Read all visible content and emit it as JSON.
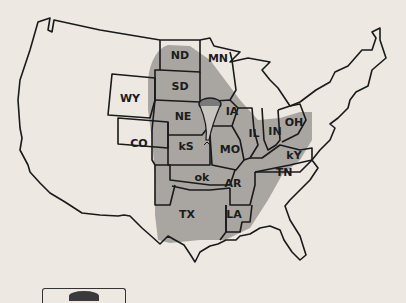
{
  "map": {
    "title": "Tornado Alley",
    "colors": {
      "background": "#ede8e2",
      "zone": "#a9a6a2",
      "outline": "#1a1a1a",
      "text": "#1c1c1c"
    },
    "labels": [
      {
        "id": "nd",
        "text": "ND",
        "x": 180,
        "y": 59
      },
      {
        "id": "mn",
        "text": "MN",
        "x": 218,
        "y": 62
      },
      {
        "id": "sd",
        "text": "SD",
        "x": 180,
        "y": 90
      },
      {
        "id": "wy",
        "text": "WY",
        "x": 130,
        "y": 102
      },
      {
        "id": "ne",
        "text": "NE",
        "x": 183,
        "y": 120
      },
      {
        "id": "ia",
        "text": "IA",
        "x": 232,
        "y": 115
      },
      {
        "id": "co",
        "text": "CO",
        "x": 139,
        "y": 147
      },
      {
        "id": "ks",
        "text": "kS",
        "x": 186,
        "y": 150
      },
      {
        "id": "il",
        "text": "IL",
        "x": 254,
        "y": 137
      },
      {
        "id": "in",
        "text": "IN",
        "x": 275,
        "y": 135
      },
      {
        "id": "oh",
        "text": "OH",
        "x": 294,
        "y": 126
      },
      {
        "id": "mo",
        "text": "MO",
        "x": 230,
        "y": 153
      },
      {
        "id": "ky",
        "text": "kY",
        "x": 294,
        "y": 159
      },
      {
        "id": "ok",
        "text": "ok",
        "x": 202,
        "y": 181
      },
      {
        "id": "ar",
        "text": "AR",
        "x": 233,
        "y": 187
      },
      {
        "id": "tn",
        "text": "TN",
        "x": 284,
        "y": 176
      },
      {
        "id": "tx",
        "text": "TX",
        "x": 187,
        "y": 218
      },
      {
        "id": "la",
        "text": "LA",
        "x": 234,
        "y": 218
      }
    ],
    "icons": {
      "tornado": "tornado-icon"
    },
    "legend": {
      "icon": "legend-swatch-icon"
    }
  }
}
